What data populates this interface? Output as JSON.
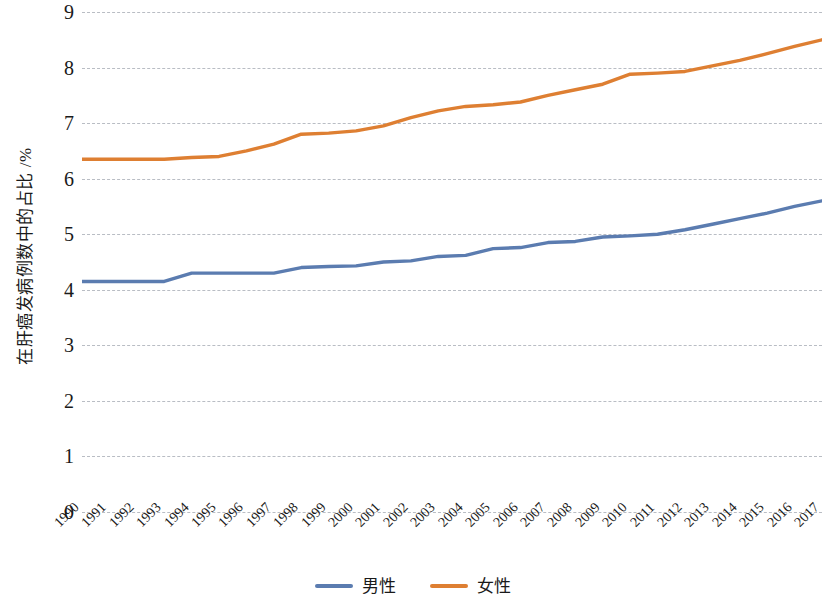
{
  "chart_data": {
    "type": "line",
    "title": "",
    "subtitle": "",
    "xlabel": "",
    "ylabel": "在肝癌发病例数中的占比 /%",
    "ylim": [
      0,
      9
    ],
    "ytick_labels": [
      "9",
      "8",
      "7",
      "6",
      "5",
      "4",
      "3",
      "2",
      "1",
      "0"
    ],
    "ytick_values": [
      9,
      8,
      7,
      6,
      5,
      4,
      3,
      2,
      1,
      0
    ],
    "grid": true,
    "grid_style": "dashed horizontal",
    "legend_position": "bottom-center",
    "x": [
      "1990",
      "1991",
      "1992",
      "1993",
      "1994",
      "1995",
      "1996",
      "1997",
      "1998",
      "1999",
      "2000",
      "2001",
      "2002",
      "2003",
      "2004",
      "2005",
      "2006",
      "2007",
      "2008",
      "2009",
      "2010",
      "2011",
      "2012",
      "2013",
      "2014",
      "2015",
      "2016",
      "2017"
    ],
    "categories": [
      "1990",
      "1991",
      "1992",
      "1993",
      "1994",
      "1995",
      "1996",
      "1997",
      "1998",
      "1999",
      "2000",
      "2001",
      "2002",
      "2003",
      "2004",
      "2005",
      "2006",
      "2007",
      "2008",
      "2009",
      "2010",
      "2011",
      "2012",
      "2013",
      "2014",
      "2015",
      "2016",
      "2017"
    ],
    "series": [
      {
        "name": "男性",
        "color": "#5B7CB0",
        "values": [
          4.15,
          4.15,
          4.15,
          4.15,
          4.3,
          4.3,
          4.3,
          4.3,
          4.4,
          4.42,
          4.43,
          4.5,
          4.52,
          4.6,
          4.62,
          4.74,
          4.76,
          4.85,
          4.87,
          4.95,
          4.97,
          5.0,
          5.08,
          5.18,
          5.28,
          5.38,
          5.5,
          5.6
        ]
      },
      {
        "name": "女性",
        "color": "#DE7F32",
        "values": [
          6.35,
          6.35,
          6.35,
          6.35,
          6.38,
          6.4,
          6.5,
          6.62,
          6.8,
          6.82,
          6.86,
          6.95,
          7.1,
          7.22,
          7.3,
          7.33,
          7.38,
          7.5,
          7.6,
          7.7,
          7.88,
          7.9,
          7.93,
          8.03,
          8.13,
          8.25,
          8.38,
          8.5
        ]
      }
    ]
  },
  "legend": {
    "items": [
      {
        "label": "男性",
        "color": "#5B7CB0"
      },
      {
        "label": "女性",
        "color": "#DE7F32"
      }
    ]
  },
  "axes": {
    "y_title": "在肝癌发病例数中的占比 /%"
  },
  "colors": {
    "male_line": "#5B7CB0",
    "female_line": "#DE7F32",
    "gridline": "#b9bdc4",
    "text": "#1a1a1a",
    "background": "#ffffff"
  }
}
